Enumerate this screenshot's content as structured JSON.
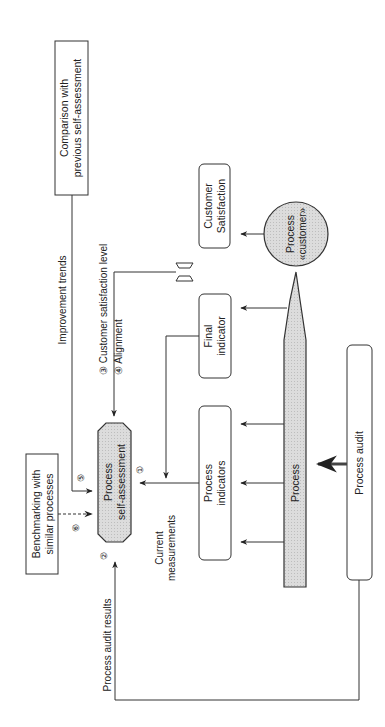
{
  "diagram": {
    "orientation": "rotated 90deg counter-clockwise",
    "colors": {
      "stroke": "#333333",
      "shaded_fill": "#d9d9d9",
      "background": "#ffffff"
    },
    "nodes": {
      "comparison": {
        "line1": "Comparison with",
        "line2": "previous self-assessment"
      },
      "customer_satisfaction": {
        "line1": "Customer",
        "line2": "Satisfaction"
      },
      "process_customer": {
        "line1": "Process",
        "line2": "«customer»"
      },
      "final_indicator": {
        "line1": "Final",
        "line2": "indicator"
      },
      "process_indicators": {
        "line1": "Process",
        "line2": "indicators"
      },
      "process": {
        "label": "Process"
      },
      "process_audit": {
        "label": "Process audit"
      },
      "self_assessment": {
        "line1": "Process",
        "line2": "self-assessment"
      },
      "benchmarking": {
        "line1": "Benchmarking with",
        "line2": "similar processes"
      }
    },
    "edge_labels": {
      "improvement_trends": "Improvement trends",
      "customer_satisfaction_level": "③ Customer satisfaction level",
      "alignment": "④ Alignment",
      "current_measurements_1": "Current",
      "current_measurements_2": "measurements",
      "process_audit_results": "Process audit results"
    },
    "markers": {
      "m1": "①",
      "m2": "②",
      "m5": "⑤",
      "m6": "⑥"
    }
  }
}
